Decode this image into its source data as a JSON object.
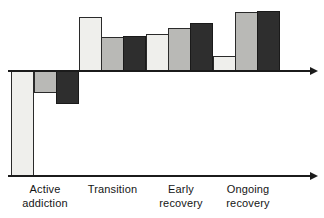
{
  "chart_data": {
    "type": "bar",
    "title": "",
    "subtitle": "",
    "xlabel": "",
    "ylabel": "",
    "grid": false,
    "legend_position": "none",
    "zero_line": true,
    "axis_arrows": true,
    "ylim": [
      -100,
      60
    ],
    "categories": [
      "Active addiction",
      "Transition",
      "Early recovery",
      "Ongoing recovery"
    ],
    "category_lines": [
      [
        "Active",
        "addiction"
      ],
      [
        "Transition",
        ""
      ],
      [
        "Early",
        "recovery"
      ],
      [
        "Ongoing",
        "recovery"
      ]
    ],
    "series": [
      {
        "name": "series-1",
        "shade": "light",
        "color": "#efefec",
        "values": [
          -100,
          52,
          36,
          14
        ]
      },
      {
        "name": "series-2",
        "shade": "medium",
        "color": "#b9b9b6",
        "values": [
          -21,
          32,
          41,
          56
        ]
      },
      {
        "name": "series-3",
        "shade": "dark",
        "color": "#2e2e2e",
        "values": [
          -31,
          33,
          46,
          57
        ]
      }
    ],
    "bars": [
      {
        "group": "Active addiction",
        "series": "series-1",
        "shade": "light",
        "value": -100,
        "x": 11,
        "width": 23,
        "top": 71,
        "height": 105
      },
      {
        "group": "Active addiction",
        "series": "series-2",
        "shade": "medium",
        "value": -21,
        "x": 34,
        "width": 23,
        "top": 71,
        "height": 22
      },
      {
        "group": "Active addiction",
        "series": "series-3",
        "shade": "dark",
        "value": -31,
        "x": 56,
        "width": 23,
        "top": 71,
        "height": 33
      },
      {
        "group": "Transition",
        "series": "series-1",
        "shade": "light",
        "value": 52,
        "x": 79,
        "width": 23,
        "top": 17,
        "height": 54
      },
      {
        "group": "Transition",
        "series": "series-2",
        "shade": "medium",
        "value": 32,
        "x": 101,
        "width": 23,
        "top": 37,
        "height": 34
      },
      {
        "group": "Transition",
        "series": "series-3",
        "shade": "dark",
        "value": 33,
        "x": 123,
        "width": 23,
        "top": 36,
        "height": 35
      },
      {
        "group": "Early recovery",
        "series": "series-1",
        "shade": "light",
        "value": 36,
        "x": 146,
        "width": 23,
        "top": 34,
        "height": 37
      },
      {
        "group": "Early recovery",
        "series": "series-2",
        "shade": "medium",
        "value": 41,
        "x": 168,
        "width": 23,
        "top": 28,
        "height": 43
      },
      {
        "group": "Early recovery",
        "series": "series-3",
        "shade": "dark",
        "value": 46,
        "x": 190,
        "width": 23,
        "top": 23,
        "height": 48
      },
      {
        "group": "Ongoing recovery",
        "series": "series-1",
        "shade": "light",
        "value": 14,
        "x": 213,
        "width": 23,
        "top": 56,
        "height": 15
      },
      {
        "group": "Ongoing recovery",
        "series": "series-2",
        "shade": "medium",
        "value": 56,
        "x": 235,
        "width": 23,
        "top": 12,
        "height": 59
      },
      {
        "group": "Ongoing recovery",
        "series": "series-3",
        "shade": "dark",
        "value": 57,
        "x": 257,
        "width": 23,
        "top": 11,
        "height": 60
      }
    ],
    "label_positions": [
      {
        "x": 5,
        "width": 80
      },
      {
        "x": 75,
        "width": 75
      },
      {
        "x": 145,
        "width": 72
      },
      {
        "x": 208,
        "width": 80
      }
    ]
  }
}
